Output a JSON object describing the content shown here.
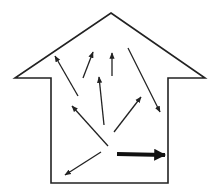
{
  "diagram": {
    "type": "house-outline-with-arrows",
    "colors": {
      "background": "#ffffff",
      "stroke": "#222222"
    },
    "house": {
      "apex": [
        111,
        13
      ],
      "left_eave": [
        15,
        78
      ],
      "right_eave": [
        205,
        78
      ],
      "left_wall_x": 51,
      "right_wall_x": 168,
      "bottom_y": 183
    },
    "arrows": [
      {
        "id": "arrow-1",
        "from": [
          78,
          96
        ],
        "to": [
          55,
          56
        ],
        "weight": "thin"
      },
      {
        "id": "arrow-2",
        "from": [
          83,
          78
        ],
        "to": [
          93,
          52
        ],
        "weight": "thin"
      },
      {
        "id": "arrow-3",
        "from": [
          112,
          76
        ],
        "to": [
          112,
          53
        ],
        "weight": "thin"
      },
      {
        "id": "arrow-4",
        "from": [
          128,
          48
        ],
        "to": [
          160,
          112
        ],
        "weight": "thin"
      },
      {
        "id": "arrow-5",
        "from": [
          104,
          125
        ],
        "to": [
          99,
          77
        ],
        "weight": "thin"
      },
      {
        "id": "arrow-6",
        "from": [
          114,
          132
        ],
        "to": [
          141,
          97
        ],
        "weight": "thin"
      },
      {
        "id": "arrow-7",
        "from": [
          108,
          146
        ],
        "to": [
          72,
          106
        ],
        "weight": "thin"
      },
      {
        "id": "arrow-8",
        "from": [
          101,
          152
        ],
        "to": [
          65,
          175
        ],
        "weight": "thin"
      },
      {
        "id": "arrow-9",
        "from": [
          117,
          154
        ],
        "to": [
          165,
          155
        ],
        "weight": "thick"
      }
    ]
  }
}
